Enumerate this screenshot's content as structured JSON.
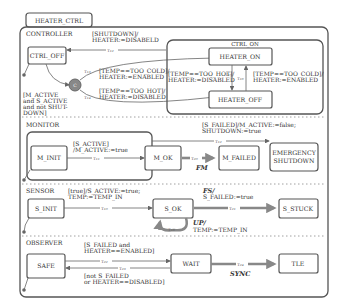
{
  "title": "HEATER_CTRL",
  "regions": {
    "controller": {
      "label": "CONTROLLER",
      "states": {
        "ctrl_off": "CTRL_OFF",
        "ctrl_on": "CTRL_ON",
        "heater_on": "HEATER_ON",
        "heater_off": "HEATER_OFF"
      },
      "choice_label": "C",
      "guards": {
        "shutdown_l1": "[SHUTDOWN]/",
        "shutdown_l2": "HEATER:=DISABELD",
        "shutdown_tau": "τ₁₂",
        "cold_l1": "[TEMP==TOO_COLD]/",
        "cold_l2": "HEATER:=ENABLED",
        "cold_tau": "τ₁₃",
        "hot_l1": "[TEMP==TOO_HOT]/",
        "hot_l2": "HEATER:=DISABLED",
        "hot_tau": "τ₁₄",
        "inner_hot_l1": "[TEMP==TOO_HOT]/",
        "inner_hot_l2": "HEATER:=DISABLED",
        "inner_hot_tau": "τ₁₅",
        "inner_cold_l1": "[TEMP==TOO_COLD]/",
        "inner_cold_l2": "HEATER:=ENABLED",
        "inner_cold_tau": "τ₁₆",
        "init_l1": "[M_ACTIVE",
        "init_l2": "and S_ACTIVE",
        "init_l3": "and   not   SHUT-",
        "init_l4": "DOWN]"
      }
    },
    "monitor": {
      "label": "MONITOR",
      "states": {
        "m_init": "M_INIT",
        "m_ok": "M_OK",
        "m_failed": "M_FAILED",
        "emergency_l1": "EMERGENCY",
        "emergency_l2": "SHUTDOWN"
      },
      "guards": {
        "init_l1": "[S_ACTIVE]",
        "init_l2": "/M_ACTIVE:=true",
        "init_tau": "τ₁₁",
        "fail_l1": "[S_FAILED]/M_ACTIVE:=false;",
        "fail_l2": "SHUTDOWN:=true",
        "fail_tau": "τ₁₂",
        "fm_tau": "τ₂₀",
        "fm_event": "FM"
      }
    },
    "sensor": {
      "label": "SENSOR",
      "states": {
        "s_init": "S_INIT",
        "s_ok": "S_OK",
        "s_stuck": "S_STUCK"
      },
      "guards": {
        "init_l1": "[true]/S_ACTIVE:=true;",
        "init_l2": "TEMP:=TEMP_IN",
        "init_tau": "τ₁₀",
        "fs_event": "FS/",
        "fs_l2": "S_FAILED:=true",
        "fs_tau": "τ₂₁",
        "up_event": "UP/",
        "up_l2": "TEMP:=TEMP_IN",
        "up_tau": "τ₁₈"
      }
    },
    "observer": {
      "label": "OBSERVER",
      "states": {
        "safe": "SAFE",
        "wait": "WAIT",
        "tle": "TLE"
      },
      "guards": {
        "fwd_l1": "[S_FAILED and",
        "fwd_l2": "HEATER==ENABLED]",
        "fwd_tau": "τ₂₂",
        "back_tau": "τ₂₃",
        "back_l1": "[not S_FAILED",
        "back_l2": "or HEATER==DISABLED]",
        "sync_tau": "τ₂₄",
        "sync_event": "SYNC"
      }
    }
  }
}
